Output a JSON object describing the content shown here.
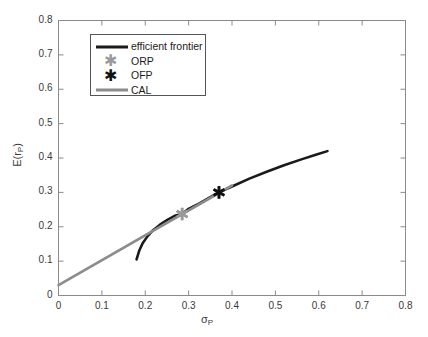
{
  "chart_data": {
    "type": "line",
    "title": "",
    "xlabel": "σ_P",
    "ylabel": "E(r_P)",
    "xlim": [
      0,
      0.8
    ],
    "ylim": [
      0,
      0.8
    ],
    "xticks": [
      "0",
      "0.1",
      "0.2",
      "0.3",
      "0.4",
      "0.5",
      "0.6",
      "0.7",
      "0.8"
    ],
    "yticks": [
      "0",
      "0.1",
      "0.2",
      "0.3",
      "0.4",
      "0.5",
      "0.6",
      "0.7",
      "0.8"
    ],
    "xtick_values": [
      0,
      0.1,
      0.2,
      0.3,
      0.4,
      0.5,
      0.6,
      0.7,
      0.8
    ],
    "ytick_values": [
      0,
      0.1,
      0.2,
      0.3,
      0.4,
      0.5,
      0.6,
      0.7,
      0.8
    ],
    "grid": false,
    "legend_position": "upper left",
    "series": [
      {
        "name": "efficient frontier",
        "type": "line",
        "color": "#1a1a1a",
        "linewidth": 2.6,
        "points": [
          [
            0.18,
            0.105
          ],
          [
            0.186,
            0.13
          ],
          [
            0.194,
            0.152
          ],
          [
            0.205,
            0.172
          ],
          [
            0.218,
            0.19
          ],
          [
            0.234,
            0.206
          ],
          [
            0.252,
            0.221
          ],
          [
            0.27,
            0.233
          ],
          [
            0.285,
            0.237
          ],
          [
            0.3,
            0.252
          ],
          [
            0.325,
            0.268
          ],
          [
            0.35,
            0.286
          ],
          [
            0.37,
            0.3
          ],
          [
            0.4,
            0.317
          ],
          [
            0.44,
            0.34
          ],
          [
            0.48,
            0.36
          ],
          [
            0.52,
            0.379
          ],
          [
            0.56,
            0.396
          ],
          [
            0.595,
            0.41
          ],
          [
            0.62,
            0.42
          ]
        ]
      },
      {
        "name": "CAL",
        "type": "line",
        "color": "#8c8c8c",
        "linewidth": 2.6,
        "points": [
          [
            0.0,
            0.03
          ],
          [
            0.4,
            0.32
          ]
        ]
      }
    ],
    "markers": [
      {
        "name": "ORP",
        "label": "ORP",
        "x": 0.285,
        "y": 0.237,
        "color": "#9a9a9a",
        "symbol": "asterisk"
      },
      {
        "name": "OFP",
        "label": "OFP",
        "x": 0.37,
        "y": 0.3,
        "color": "#111111",
        "symbol": "asterisk"
      }
    ],
    "legend_entries": [
      {
        "label": "efficient frontier",
        "kind": "line",
        "color": "#1a1a1a"
      },
      {
        "label": "ORP",
        "kind": "marker",
        "color": "#9a9a9a"
      },
      {
        "label": "OFP",
        "kind": "marker",
        "color": "#111111"
      },
      {
        "label": "CAL",
        "kind": "line",
        "color": "#8c8c8c"
      }
    ],
    "axis_color": "#8a8a8a",
    "background": "#ffffff"
  },
  "axes": {
    "ylabel_main": "E(r",
    "ylabel_sub": "P",
    "ylabel_close": ")",
    "xlabel_main": "σ",
    "xlabel_sub": "P"
  }
}
